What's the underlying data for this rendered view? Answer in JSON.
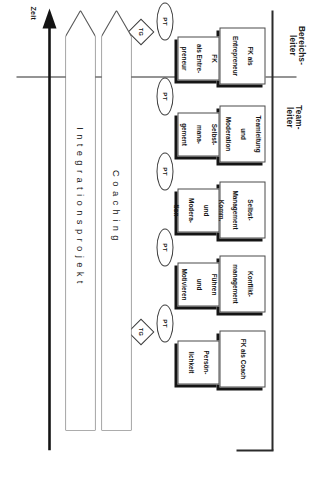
{
  "diagram": {
    "columns": [
      {
        "id": "teamleiter",
        "label_line1": "Team-",
        "label_line2": "leiter"
      },
      {
        "id": "bereichsleiter",
        "label_line1": "Bereichs-",
        "label_line2": "leiter"
      }
    ],
    "teamleiter_modules": [
      {
        "lines": [
          "Persön-",
          "lichkeit"
        ]
      },
      {
        "lines": [
          "Führen",
          "und",
          "Motivieren"
        ]
      },
      {
        "lines": [
          "Komm.",
          "und",
          "Modera-",
          "tion"
        ]
      },
      {
        "lines": [
          "Selbst-",
          "mana-",
          "gement"
        ]
      },
      {
        "lines": [
          "FK",
          "als Entre-",
          "preneur"
        ]
      }
    ],
    "bereichsleiter_modules": [
      {
        "lines": [
          "FK als Coach"
        ]
      },
      {
        "lines": [
          "Konflikt-",
          "management"
        ]
      },
      {
        "lines": [
          "Selbst-",
          "Management"
        ]
      },
      {
        "lines": [
          "Teamleitung",
          "und",
          "Moderation"
        ]
      },
      {
        "lines": [
          "FK als",
          "Entrepreneur"
        ]
      }
    ],
    "pt_markers": [
      {
        "label": "PT"
      },
      {
        "label": "PT"
      },
      {
        "label": "PT"
      },
      {
        "label": "PT"
      },
      {
        "label": "PT"
      }
    ],
    "tg_markers": [
      {
        "label": "TG"
      },
      {
        "label": "TG"
      }
    ],
    "arrows": [
      {
        "id": "integrationsprojekt",
        "label": "Integrationsprojekt"
      },
      {
        "id": "coaching",
        "label": "Coaching"
      }
    ],
    "time_axis": {
      "label": "Zeit",
      "direction": "down"
    },
    "colors": {
      "line": "#2b2b2b",
      "shadow": "#151515",
      "text": "#141414",
      "background": "#ffffff"
    }
  }
}
